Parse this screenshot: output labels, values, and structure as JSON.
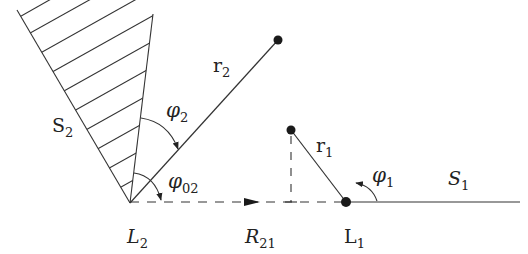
{
  "diagram": {
    "type": "geometry",
    "stroke_color": "#333333",
    "points": {
      "L2": {
        "label": "L",
        "sub": "2",
        "x": 130,
        "y": 203
      },
      "L1": {
        "label": "L",
        "sub": "1",
        "x": 346,
        "y": 202
      },
      "r2_end": {
        "x": 278,
        "y": 40
      },
      "r1_end": {
        "x": 291,
        "y": 130
      }
    },
    "labels": {
      "S2": {
        "main": "S",
        "sub": "2"
      },
      "S1": {
        "main": "S",
        "sub": "1"
      },
      "r2": {
        "main": "r",
        "sub": "2"
      },
      "r1": {
        "main": "r",
        "sub": "1"
      },
      "phi2": {
        "main": "φ",
        "sub": "2"
      },
      "phi02": {
        "main": "φ",
        "sub": "02"
      },
      "phi1": {
        "main": "φ",
        "sub": "1"
      },
      "L2": {
        "main": "L",
        "sub": "2"
      },
      "R21": {
        "main": "R",
        "sub": "21"
      },
      "L1": {
        "main": "L",
        "sub": "1"
      }
    },
    "elements": [
      "hatched wedge S2 at L2",
      "segment r2 from L2",
      "dashed baseline L2 to L1 with arrow (R21)",
      "segment r1 from L1",
      "dashed vertical drop from r1 endpoint",
      "ray S1 from L1 to the right",
      "angle arcs phi2, phi02, phi1"
    ]
  }
}
